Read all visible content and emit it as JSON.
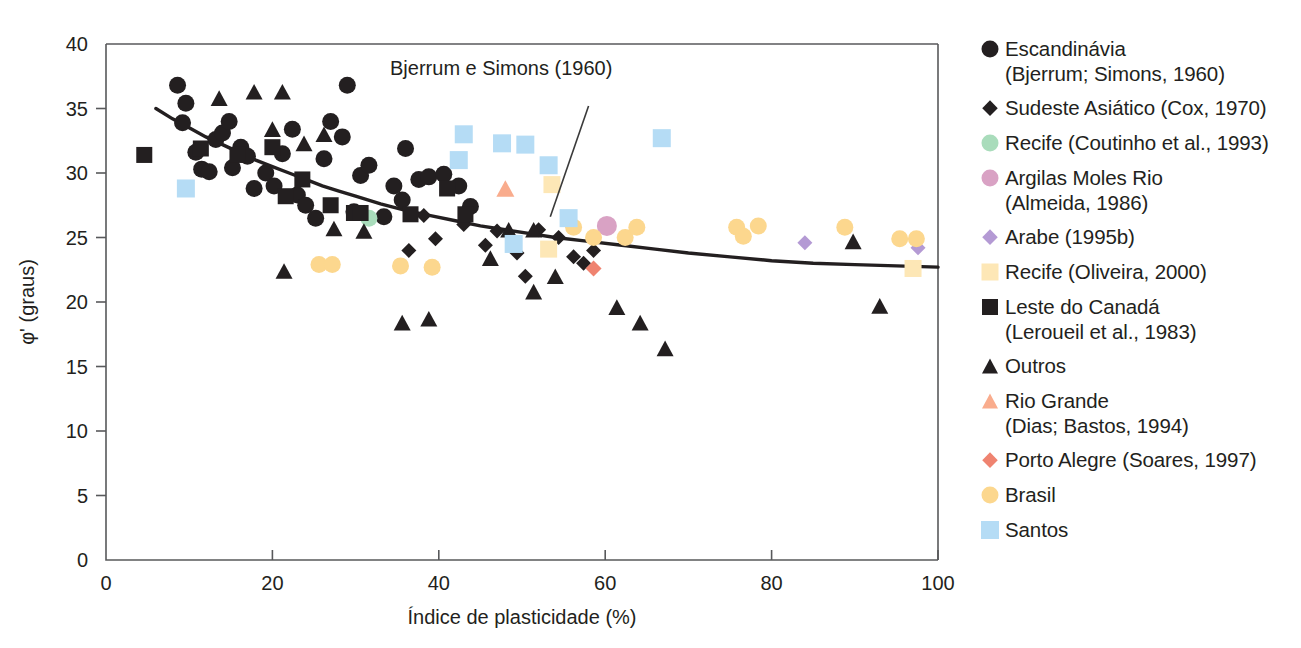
{
  "figure": {
    "background": "#ffffff",
    "width": 1301,
    "height": 648
  },
  "annotation": {
    "text": "Bjerrum e Simons (1960)",
    "x": 47.5,
    "y": 37.6,
    "leader_from_x": 58.0,
    "leader_from_y": 35.2,
    "leader_to_x": 53.4,
    "leader_to_y": 26.6
  },
  "legend": {
    "position": "right",
    "items": [
      {
        "label": "Escandinávia\n(Bjerrum; Simons, 1960)",
        "marker": "circle",
        "color": "#231f20",
        "size": 17
      },
      {
        "label": "Sudeste Asiático (Cox, 1970)",
        "marker": "diamond",
        "color": "#231f20",
        "size": 15
      },
      {
        "label": "Recife (Coutinho et al., 1993)",
        "marker": "circle",
        "color": "#a9dcbb",
        "size": 17
      },
      {
        "label": "Argilas Moles Rio\n(Almeida, 1986)",
        "marker": "circle",
        "color": "#d9a2c4",
        "size": 17
      },
      {
        "label": "Arabe (1995b)",
        "marker": "diamond",
        "color": "#b49ad4",
        "size": 15
      },
      {
        "label": "Recife (Oliveira, 2000)",
        "marker": "square",
        "color": "#fde7b6",
        "size": 17
      },
      {
        "label": "Leste do Canadá\n(Leroueil et al., 1983)",
        "marker": "square",
        "color": "#231f20",
        "size": 16
      },
      {
        "label": "Outros",
        "marker": "triangle",
        "color": "#231f20",
        "size": 17
      },
      {
        "label": "Rio Grande\n(Dias; Bastos, 1994)",
        "marker": "triangle",
        "color": "#f9ac8d",
        "size": 17
      },
      {
        "label": "Porto Alegre (Soares, 1997)",
        "marker": "diamond",
        "color": "#ef8370",
        "size": 15
      },
      {
        "label": "Brasil",
        "marker": "circle",
        "color": "#fcd78e",
        "size": 17
      },
      {
        "label": "Santos",
        "marker": "square",
        "color": "#b5dcf5",
        "size": 18
      }
    ]
  },
  "chart_data": {
    "type": "scatter",
    "title": "",
    "xlabel": "Índice de plasticidade (%)",
    "ylabel": "φ' (graus)",
    "xlim": [
      0,
      100
    ],
    "ylim": [
      0,
      40
    ],
    "xticks": [
      0,
      20,
      40,
      60,
      80,
      100
    ],
    "yticks": [
      0,
      5,
      10,
      15,
      20,
      25,
      30,
      35,
      40
    ],
    "grid": false,
    "legend_position": "right",
    "fit_curve": {
      "name": "Bjerrum e Simons (1960)",
      "color": "#231f20",
      "points": [
        [
          6.0,
          35.0
        ],
        [
          8.0,
          34.2
        ],
        [
          10.0,
          33.5
        ],
        [
          12.0,
          32.8
        ],
        [
          14.0,
          32.2
        ],
        [
          16.0,
          31.6
        ],
        [
          18.0,
          31.0
        ],
        [
          20.0,
          30.5
        ],
        [
          22.0,
          30.0
        ],
        [
          24.0,
          29.5
        ],
        [
          26.0,
          29.0
        ],
        [
          28.0,
          28.6
        ],
        [
          30.0,
          28.2
        ],
        [
          33.0,
          27.6
        ],
        [
          36.0,
          27.1
        ],
        [
          39.0,
          26.7
        ],
        [
          42.0,
          26.3
        ],
        [
          45.0,
          25.9
        ],
        [
          48.0,
          25.6
        ],
        [
          51.0,
          25.3
        ],
        [
          54.0,
          25.0
        ],
        [
          58.0,
          24.7
        ],
        [
          62.0,
          24.4
        ],
        [
          66.0,
          24.1
        ],
        [
          70.0,
          23.8
        ],
        [
          75.0,
          23.5
        ],
        [
          80.0,
          23.2
        ],
        [
          85.0,
          23.0
        ],
        [
          90.0,
          22.9
        ],
        [
          95.0,
          22.8
        ],
        [
          100.0,
          22.7
        ]
      ]
    },
    "series": [
      {
        "name": "Escandinávia (Bjerrum; Simons, 1960)",
        "marker": "circle",
        "color": "#231f20",
        "size": 17,
        "points": [
          [
            8.6,
            36.8
          ],
          [
            9.2,
            33.9
          ],
          [
            9.6,
            35.4
          ],
          [
            10.8,
            31.6
          ],
          [
            11.5,
            30.3
          ],
          [
            12.4,
            30.1
          ],
          [
            13.2,
            32.6
          ],
          [
            14.0,
            33.1
          ],
          [
            14.8,
            34.0
          ],
          [
            15.2,
            30.4
          ],
          [
            16.2,
            32.0
          ],
          [
            17.0,
            31.3
          ],
          [
            17.8,
            28.8
          ],
          [
            19.2,
            30.0
          ],
          [
            20.2,
            29.0
          ],
          [
            21.2,
            31.5
          ],
          [
            22.4,
            33.4
          ],
          [
            23.0,
            28.3
          ],
          [
            24.0,
            27.5
          ],
          [
            25.2,
            26.5
          ],
          [
            26.2,
            31.1
          ],
          [
            27.0,
            34.0
          ],
          [
            28.4,
            32.8
          ],
          [
            29.0,
            36.8
          ],
          [
            29.8,
            27.0
          ],
          [
            30.6,
            29.8
          ],
          [
            31.6,
            30.6
          ],
          [
            33.4,
            26.6
          ],
          [
            34.6,
            29.0
          ],
          [
            35.6,
            27.9
          ],
          [
            36.0,
            31.9
          ],
          [
            37.6,
            29.5
          ],
          [
            38.8,
            29.7
          ],
          [
            40.6,
            29.9
          ],
          [
            42.4,
            29.0
          ],
          [
            43.8,
            27.4
          ]
        ]
      },
      {
        "name": "Sudeste Asiático (Cox, 1970)",
        "marker": "diamond",
        "color": "#231f20",
        "size": 15,
        "points": [
          [
            38.2,
            26.7
          ],
          [
            39.6,
            24.9
          ],
          [
            43.0,
            26.0
          ],
          [
            45.6,
            24.4
          ],
          [
            47.0,
            25.5
          ],
          [
            49.4,
            23.8
          ],
          [
            50.4,
            22.0
          ],
          [
            52.0,
            25.6
          ],
          [
            54.4,
            25.0
          ],
          [
            56.2,
            23.5
          ],
          [
            57.4,
            23.0
          ],
          [
            58.6,
            24.0
          ],
          [
            36.4,
            24.0
          ]
        ]
      },
      {
        "name": "Recife (Coutinho et al., 1993)",
        "marker": "circle",
        "color": "#a9dcbb",
        "size": 17,
        "points": [
          [
            31.6,
            26.5
          ]
        ]
      },
      {
        "name": "Argilas Moles Rio (Almeida, 1986)",
        "marker": "circle",
        "color": "#d9a2c4",
        "size": 20,
        "points": [
          [
            60.2,
            25.9
          ]
        ]
      },
      {
        "name": "Arabe (1995b)",
        "marker": "diamond",
        "color": "#b49ad4",
        "size": 15,
        "points": [
          [
            84.0,
            24.6
          ],
          [
            97.6,
            24.2
          ]
        ]
      },
      {
        "name": "Recife (Oliveira, 2000)",
        "marker": "square",
        "color": "#fde7b6",
        "size": 17,
        "points": [
          [
            53.6,
            29.1
          ],
          [
            53.2,
            24.1
          ],
          [
            97.0,
            22.6
          ]
        ]
      },
      {
        "name": "Leste do Canadá (Leroueil et al., 1983)",
        "marker": "square",
        "color": "#231f20",
        "size": 16,
        "points": [
          [
            4.6,
            31.4
          ],
          [
            11.4,
            31.9
          ],
          [
            15.8,
            31.4
          ],
          [
            20.0,
            32.0
          ],
          [
            21.6,
            28.2
          ],
          [
            23.6,
            29.5
          ],
          [
            27.0,
            27.5
          ],
          [
            29.8,
            26.9
          ],
          [
            30.6,
            26.9
          ],
          [
            36.6,
            26.8
          ],
          [
            41.0,
            28.8
          ],
          [
            43.2,
            26.8
          ]
        ]
      },
      {
        "name": "Outros",
        "marker": "triangle",
        "color": "#231f20",
        "size": 17,
        "points": [
          [
            13.6,
            35.8
          ],
          [
            17.8,
            36.3
          ],
          [
            21.2,
            36.3
          ],
          [
            20.0,
            33.4
          ],
          [
            23.8,
            32.3
          ],
          [
            26.2,
            33.0
          ],
          [
            21.4,
            22.4
          ],
          [
            27.4,
            25.7
          ],
          [
            31.0,
            25.5
          ],
          [
            35.6,
            18.4
          ],
          [
            38.8,
            18.7
          ],
          [
            46.2,
            23.4
          ],
          [
            48.4,
            25.6
          ],
          [
            51.4,
            25.6
          ],
          [
            51.4,
            20.8
          ],
          [
            54.0,
            22.0
          ],
          [
            61.4,
            19.6
          ],
          [
            64.2,
            18.4
          ],
          [
            67.2,
            16.4
          ],
          [
            93.0,
            19.7
          ],
          [
            89.8,
            24.7
          ]
        ]
      },
      {
        "name": "Rio Grande (Dias; Bastos, 1994)",
        "marker": "triangle",
        "color": "#f9ac8d",
        "size": 18,
        "points": [
          [
            48.0,
            28.8
          ]
        ]
      },
      {
        "name": "Porto Alegre (Soares, 1997)",
        "marker": "diamond",
        "color": "#ef8370",
        "size": 16,
        "points": [
          [
            58.6,
            22.6
          ]
        ]
      },
      {
        "name": "Brasil",
        "marker": "circle",
        "color": "#fcd78e",
        "size": 17,
        "points": [
          [
            25.6,
            22.9
          ],
          [
            27.2,
            22.9
          ],
          [
            35.4,
            22.8
          ],
          [
            39.2,
            22.7
          ],
          [
            56.2,
            25.8
          ],
          [
            58.6,
            25.0
          ],
          [
            62.4,
            25.0
          ],
          [
            63.8,
            25.8
          ],
          [
            75.8,
            25.8
          ],
          [
            76.6,
            25.1
          ],
          [
            78.4,
            25.9
          ],
          [
            88.8,
            25.8
          ],
          [
            95.4,
            24.9
          ],
          [
            97.4,
            24.9
          ]
        ]
      },
      {
        "name": "Santos",
        "marker": "square",
        "color": "#b5dcf5",
        "size": 18,
        "points": [
          [
            9.6,
            28.8
          ],
          [
            43.0,
            33.0
          ],
          [
            42.4,
            31.0
          ],
          [
            47.6,
            32.3
          ],
          [
            50.4,
            32.2
          ],
          [
            53.2,
            30.6
          ],
          [
            55.6,
            26.5
          ],
          [
            49.0,
            24.5
          ],
          [
            66.8,
            32.7
          ]
        ]
      }
    ]
  }
}
